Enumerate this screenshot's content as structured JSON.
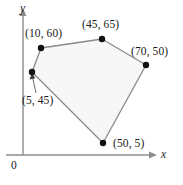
{
  "figure": {
    "axes": {
      "y_label": "y",
      "x_label": "x",
      "origin_label": "0",
      "x_axis_color": "#8c8c8c",
      "y_axis_color": "#8c8c8c"
    },
    "polygon": {
      "fill_color": "#f7f7f7",
      "edge_color": "#8a8a8a",
      "vertex_color": "#111111",
      "vertices": [
        {
          "name": "vertex-10-60",
          "label": "(10, 60)",
          "x": 10,
          "y": 60,
          "px": 41,
          "py": 48
        },
        {
          "name": "vertex-45-65",
          "label": "(45, 65)",
          "x": 45,
          "y": 65,
          "px": 102,
          "py": 39
        },
        {
          "name": "vertex-70-50",
          "label": "(70, 50)",
          "x": 70,
          "y": 50,
          "px": 146,
          "py": 65
        },
        {
          "name": "vertex-50-5",
          "label": "(50, 5)",
          "x": 50,
          "y": 5,
          "px": 103,
          "py": 143
        },
        {
          "name": "vertex-5-45",
          "label": "(5, 45)",
          "x": 5,
          "y": 45,
          "px": 32,
          "py": 72
        }
      ]
    },
    "leader_line": {
      "name": "leader-to-vertex-5-45",
      "from_label": "(5, 45)",
      "to_vertex": "vertex-5-45"
    }
  },
  "chart_data": {
    "type": "scatter",
    "title": "",
    "xlabel": "x",
    "ylabel": "y",
    "grid": false,
    "legend": null,
    "annotations": [
      "(10, 60)",
      "(45, 65)",
      "(70, 50)",
      "(50, 5)",
      "(5, 45)",
      "0"
    ],
    "points": [
      {
        "label": "(10, 60)",
        "x": 10,
        "y": 60
      },
      {
        "label": "(45, 65)",
        "x": 45,
        "y": 65
      },
      {
        "label": "(70, 50)",
        "x": 70,
        "y": 50
      },
      {
        "label": "(50, 5)",
        "x": 50,
        "y": 5
      },
      {
        "label": "(5, 45)",
        "x": 5,
        "y": 45
      }
    ],
    "series": [
      {
        "name": "polygon boundary",
        "x": [
          10,
          45,
          70,
          50,
          5,
          10
        ],
        "y": [
          60,
          65,
          50,
          5,
          45,
          60
        ]
      }
    ],
    "xlim": [
      0,
      80
    ],
    "ylim": [
      0,
      75
    ]
  }
}
